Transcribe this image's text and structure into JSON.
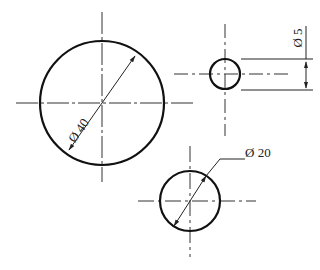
{
  "diagram": {
    "type": "engineering-drawing",
    "colors": {
      "outline": "#111111",
      "centerline": "#333333",
      "dimension": "#222222",
      "background": "#ffffff"
    },
    "circles": [
      {
        "id": "large",
        "cx": 102,
        "cy": 103,
        "r": 62,
        "dimension_label": "Ø 40"
      },
      {
        "id": "small",
        "cx": 225,
        "cy": 74,
        "r": 15,
        "dimension_label": "Ø 5"
      },
      {
        "id": "medium",
        "cx": 190,
        "cy": 201,
        "r": 30,
        "dimension_label": "Ø 20"
      }
    ],
    "labels": {
      "large": "Ø 40",
      "small": "Ø 5",
      "medium": "Ø 20"
    }
  }
}
